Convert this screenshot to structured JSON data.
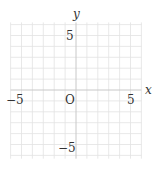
{
  "chart_data": {
    "type": "scatter",
    "title": "",
    "xlabel": "x",
    "ylabel": "y",
    "xlim": [
      -6,
      6
    ],
    "ylim": [
      -6.3,
      6.2
    ],
    "grid": true,
    "grid_step": 1,
    "origin_label": "O",
    "x_tick_labels": [
      {
        "value": -5,
        "label": "−5"
      },
      {
        "value": 5,
        "label": "5"
      }
    ],
    "y_tick_labels": [
      {
        "value": 5,
        "label": "5"
      },
      {
        "value": -5,
        "label": "−5"
      }
    ],
    "series": []
  },
  "colors": {
    "grid": "#e2e2e2",
    "axis": "#c8c8c8",
    "text": "#333333",
    "background": "#ffffff"
  }
}
